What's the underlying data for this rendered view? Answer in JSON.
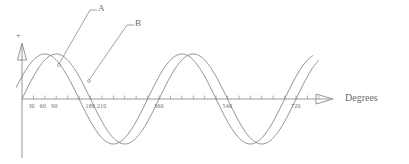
{
  "figure": {
    "background_color": "#ffffff",
    "stroke_color": "#7a7a7a",
    "text_color": "#6b6b6b"
  },
  "axes": {
    "x_axis_name": "Degrees",
    "x_axis_arrow": "triangle-right-icon",
    "y_axis_arrow": "triangle-up-icon",
    "y_axis_positive_sign": "+"
  },
  "labels": {
    "curve_a": "A",
    "curve_b": "B"
  },
  "chart_data": {
    "type": "line",
    "title": "",
    "subtitle": "",
    "xlabel": "Degrees",
    "ylabel": "",
    "xlim": [
      -30,
      810
    ],
    "ylim": [
      -1.15,
      1.15
    ],
    "grid": false,
    "legend": "leader-lines",
    "x_tick_interval": 30,
    "x_tick_labels": [
      "30",
      "60",
      "90",
      "180",
      "210",
      "360",
      "540",
      "720"
    ],
    "x_tick_label_values": [
      30,
      60,
      90,
      180,
      210,
      360,
      540,
      720
    ],
    "x_ticks_unlabeled_values": [
      120,
      150,
      240,
      270,
      300,
      330,
      390,
      420,
      450,
      480,
      510,
      570,
      600,
      630,
      660,
      690,
      750,
      780
    ],
    "annotations": [
      {
        "text": "A",
        "points_to_series": "A",
        "points_to_x": 105,
        "points_to_y": 0.97
      },
      {
        "text": "B",
        "points_to_series": "B",
        "points_to_x": 190,
        "points_to_y": 0.38
      }
    ],
    "series": [
      {
        "name": "A",
        "color": "#7a7a7a",
        "amplitude": 1.0,
        "period_degrees": 360,
        "phase_degrees": 0,
        "equation": "y = sin(x)",
        "zero_crossings_degrees": [
          0,
          180,
          360,
          540,
          720
        ],
        "peaks_degrees": [
          90,
          450
        ],
        "troughs_degrees": [
          270,
          630
        ],
        "x_start": 0,
        "x_end": 780,
        "x": [
          0,
          30,
          60,
          90,
          120,
          150,
          180,
          210,
          240,
          270,
          300,
          330,
          360,
          390,
          420,
          450,
          480,
          510,
          540,
          570,
          600,
          630,
          660,
          690,
          720,
          750,
          780
        ],
        "y": [
          0.0,
          0.5,
          0.87,
          1.0,
          0.87,
          0.5,
          0.0,
          -0.5,
          -0.87,
          -1.0,
          -0.87,
          -0.5,
          0.0,
          0.5,
          0.87,
          1.0,
          0.87,
          0.5,
          0.0,
          -0.5,
          -0.87,
          -1.0,
          -0.87,
          -0.5,
          0.0,
          0.5,
          0.87
        ]
      },
      {
        "name": "B",
        "color": "#7a7a7a",
        "amplitude": 1.0,
        "period_degrees": 360,
        "phase_degrees": -30,
        "equation": "y = sin(x - 30)",
        "zero_crossings_degrees": [
          30,
          210,
          390,
          570,
          750
        ],
        "peaks_degrees": [
          120,
          480
        ],
        "troughs_degrees": [
          300,
          660
        ],
        "x_start": -15,
        "x_end": 765,
        "x": [
          -15,
          15,
          45,
          75,
          105,
          135,
          165,
          195,
          225,
          255,
          285,
          315,
          345,
          375,
          405,
          435,
          465,
          495,
          525,
          555,
          585,
          615,
          645,
          675,
          705,
          735,
          765
        ],
        "y": [
          -0.71,
          -0.26,
          0.26,
          0.71,
          0.97,
          0.97,
          0.71,
          0.26,
          -0.26,
          -0.71,
          -0.97,
          -0.97,
          -0.71,
          -0.26,
          0.26,
          0.71,
          0.97,
          0.97,
          0.71,
          0.26,
          -0.26,
          -0.71,
          -0.97,
          -0.97,
          -0.71,
          -0.26,
          0.26
        ]
      }
    ]
  }
}
